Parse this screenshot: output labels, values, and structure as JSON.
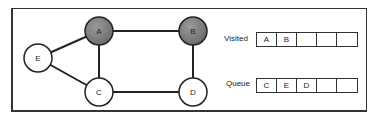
{
  "graph": {
    "nodes": [
      {
        "id": "A",
        "label": "A",
        "visited": true
      },
      {
        "id": "B",
        "label": "B",
        "visited": true
      },
      {
        "id": "C",
        "label": "C",
        "visited": false
      },
      {
        "id": "D",
        "label": "D",
        "visited": false
      },
      {
        "id": "E",
        "label": "E",
        "visited": false
      }
    ],
    "edges": [
      [
        "A",
        "B"
      ],
      [
        "A",
        "C"
      ],
      [
        "A",
        "E"
      ],
      [
        "B",
        "D"
      ],
      [
        "C",
        "D"
      ],
      [
        "C",
        "E"
      ]
    ],
    "colors": {
      "visited_fill": "#808080",
      "unvisited_fill": "#ffffff",
      "stroke": "#222222"
    }
  },
  "visited": {
    "label": "Visited",
    "cells": [
      "A",
      "B",
      "",
      "",
      ""
    ]
  },
  "queue": {
    "label": "Queue",
    "cells": [
      "C",
      "E",
      "D",
      "",
      ""
    ]
  }
}
